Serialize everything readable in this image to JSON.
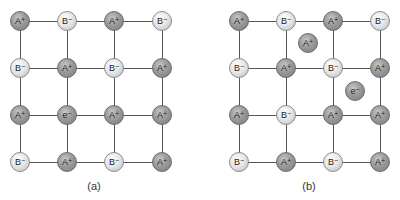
{
  "diagram": {
    "colors": {
      "cation_fill": "#9a9a9a",
      "anion_fill": "#e4e4e4",
      "bond_line": "#555555",
      "background": "#ffffff"
    },
    "panels": [
      {
        "id": "a",
        "caption": "(a)",
        "columns_x": [
          20,
          67,
          114,
          162
        ],
        "rows_y": [
          21,
          68,
          115,
          162
        ],
        "grid": [
          [
            {
              "base": "A",
              "charge": "+",
              "type": "cation"
            },
            {
              "base": "B",
              "charge": "−",
              "type": "anion"
            },
            {
              "base": "A",
              "charge": "+",
              "type": "cation"
            },
            {
              "base": "B",
              "charge": "−",
              "type": "anion"
            }
          ],
          [
            {
              "base": "B",
              "charge": "−",
              "type": "anion"
            },
            {
              "base": "A",
              "charge": "+",
              "type": "cation"
            },
            {
              "base": "B",
              "charge": "−",
              "type": "anion"
            },
            {
              "base": "A",
              "charge": "+",
              "type": "cation"
            }
          ],
          [
            {
              "base": "A",
              "charge": "+",
              "type": "cation"
            },
            {
              "base": "e",
              "charge": "−",
              "type": "electron"
            },
            {
              "base": "A",
              "charge": "+",
              "type": "cation"
            },
            {
              "base": "A",
              "charge": "+",
              "type": "cation"
            }
          ],
          [
            {
              "base": "B",
              "charge": "−",
              "type": "anion"
            },
            {
              "base": "A",
              "charge": "+",
              "type": "cation"
            },
            {
              "base": "B",
              "charge": "−",
              "type": "anion"
            },
            {
              "base": "A",
              "charge": "+",
              "type": "cation"
            }
          ]
        ],
        "interstitials": []
      },
      {
        "id": "b",
        "caption": "(b)",
        "columns_x": [
          239,
          286,
          333,
          380
        ],
        "rows_y": [
          21,
          68,
          115,
          162
        ],
        "grid": [
          [
            {
              "base": "A",
              "charge": "+",
              "type": "cation"
            },
            {
              "base": "B",
              "charge": "−",
              "type": "anion"
            },
            {
              "base": "A",
              "charge": "+",
              "type": "cation"
            },
            {
              "base": "B",
              "charge": "−",
              "type": "anion"
            }
          ],
          [
            {
              "base": "B",
              "charge": "−",
              "type": "anion"
            },
            {
              "base": "A",
              "charge": "+",
              "type": "cation"
            },
            {
              "base": "B",
              "charge": "−",
              "type": "anion"
            },
            {
              "base": "A",
              "charge": "+",
              "type": "cation"
            }
          ],
          [
            {
              "base": "A",
              "charge": "+",
              "type": "cation"
            },
            {
              "base": "B",
              "charge": "−",
              "type": "anion"
            },
            {
              "base": "A",
              "charge": "+",
              "type": "cation"
            },
            {
              "base": "A",
              "charge": "+",
              "type": "cation"
            }
          ],
          [
            {
              "base": "B",
              "charge": "−",
              "type": "anion"
            },
            {
              "base": "A",
              "charge": "+",
              "type": "cation"
            },
            {
              "base": "B",
              "charge": "−",
              "type": "anion"
            },
            {
              "base": "A",
              "charge": "+",
              "type": "cation"
            }
          ]
        ],
        "interstitials": [
          {
            "base": "A",
            "charge": "+",
            "type": "cation",
            "x": 308,
            "y": 43
          },
          {
            "base": "e",
            "charge": "−",
            "type": "electron",
            "x": 355,
            "y": 91
          }
        ]
      }
    ]
  },
  "captions": {
    "a": "(a)",
    "b": "(b)"
  }
}
